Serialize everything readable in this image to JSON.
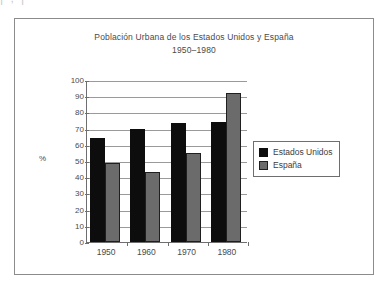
{
  "page_bleed": {
    "text": "|         ;                                    |"
  },
  "chart_data": {
    "type": "bar",
    "title": "Población Urbana de los Estados Unidos y España",
    "subtitle": "1950–1980",
    "xlabel": "",
    "ylabel": "%",
    "ylim": [
      0,
      100
    ],
    "ytick_step": 10,
    "grid": true,
    "legend_position": "right",
    "categories": [
      "1950",
      "1960",
      "1970",
      "1980"
    ],
    "ytick_labels": [
      "100",
      "90",
      "80",
      "70",
      "60",
      "50",
      "40",
      "30",
      "20",
      "10",
      "0"
    ],
    "series": [
      {
        "name": "Estados Unidos",
        "color": "#0d0d0d",
        "values": [
          64,
          70,
          73.5,
          74
        ]
      },
      {
        "name": "España",
        "color": "#6b6b6b",
        "values": [
          48.5,
          43,
          55,
          92
        ]
      }
    ]
  },
  "legend": {
    "items": [
      {
        "label": "Estados Unidos",
        "swatch": "us"
      },
      {
        "label": "España",
        "swatch": "es"
      }
    ]
  }
}
